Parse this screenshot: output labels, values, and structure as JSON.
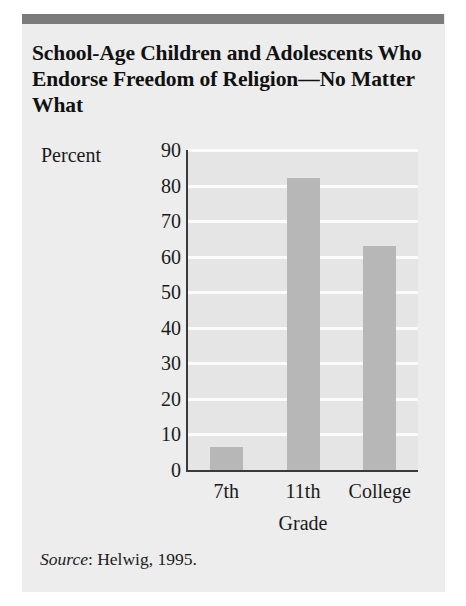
{
  "figure": {
    "title": "School-Age Children and Adolescents Who Endorse Freedom of Religion—No Matter What",
    "source_word": "Source",
    "source_rest": ": Helwig, 1995.",
    "panel_color": "#ecedec",
    "rule_color": "#7b7b7b",
    "bar_color": "#b6b7b6",
    "gridline_color": "#fbfbfb",
    "axis_color": "#3a3a3a"
  },
  "chart_data": {
    "type": "bar",
    "title": "School-Age Children and Adolescents Who Endorse Freedom of Religion—No Matter What",
    "categories": [
      "7th",
      "11th",
      "College"
    ],
    "values": [
      6.5,
      82,
      63
    ],
    "xlabel": "Grade",
    "ylabel": "Percent",
    "ylim": [
      0,
      90
    ],
    "yticks": [
      0,
      10,
      20,
      30,
      40,
      50,
      60,
      70,
      80,
      90
    ],
    "ytick_labels": [
      "0",
      "10",
      "20",
      "30",
      "40",
      "50",
      "60",
      "70",
      "80",
      "90"
    ],
    "grid": true,
    "legend": "none",
    "source": "Source: Helwig, 1995."
  }
}
